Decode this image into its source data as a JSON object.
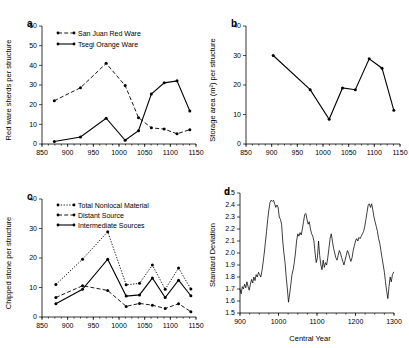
{
  "figure": {
    "title": "",
    "panels": [
      "a",
      "b",
      "c",
      "d"
    ]
  },
  "panel_a": {
    "letter": "a",
    "ylabel": "Red ware sherds per structure",
    "xlabel": "",
    "legend": [
      {
        "label": "San Juan Red Ware",
        "style": "dashed"
      },
      {
        "label": "Tsegi Orange Ware",
        "style": "solid"
      }
    ],
    "yticks": [
      "0",
      "10",
      "20",
      "30",
      "40",
      "50",
      "60"
    ],
    "xticks": [
      "850",
      "900",
      "950",
      "1000",
      "1050",
      "1100",
      "1150"
    ]
  },
  "panel_b": {
    "letter": "b",
    "ylabel": "Storage area (m²) per structure",
    "xlabel": "",
    "yticks": [
      "0",
      "10",
      "20",
      "30",
      "40"
    ],
    "xticks": [
      "850",
      "900",
      "950",
      "1000",
      "1050",
      "1100",
      "1150"
    ]
  },
  "panel_c": {
    "letter": "c",
    "ylabel": "Chipped stone per structure",
    "xlabel": "",
    "legend": [
      {
        "label": "Total Nonlocal Material",
        "style": "dotted"
      },
      {
        "label": "Distant Source",
        "style": "dashed"
      },
      {
        "label": "Intermediate Sources",
        "style": "solid"
      }
    ],
    "yticks": [
      "0",
      "10",
      "20",
      "30",
      "40"
    ],
    "xticks": [
      "850",
      "900",
      "950",
      "1000",
      "1050",
      "1100",
      "1150"
    ]
  },
  "panel_d": {
    "letter": "d",
    "ylabel": "Standard  Deviation",
    "xlabel": "Central Year",
    "yticks": [
      "1.5",
      "1.6",
      "1.7",
      "1.8",
      "1.9",
      "2.0",
      "2.1",
      "2.2",
      "2.3",
      "2.4",
      "2.5"
    ],
    "xticks": [
      "900",
      "1000",
      "1100",
      "1200",
      "1300"
    ]
  },
  "chart_data": [
    {
      "id": "panel_a",
      "type": "line",
      "title": "a",
      "xlabel": "",
      "ylabel": "Red ware sherds per structure",
      "xlim": [
        850,
        1150
      ],
      "ylim": [
        0,
        60
      ],
      "grid": false,
      "legend_position": "top-left",
      "series": [
        {
          "name": "San Juan Red Ware",
          "style": "dashed",
          "marker": "circle",
          "x": [
            874,
            925,
            975,
            1012,
            1038,
            1063,
            1088,
            1113,
            1138
          ],
          "y": [
            22,
            28.6,
            41,
            29.7,
            13.4,
            8.2,
            7.6,
            5.2,
            7.3
          ]
        },
        {
          "name": "Tsegi Orange Ware",
          "style": "solid",
          "marker": "circle",
          "x": [
            874,
            925,
            975,
            1012,
            1038,
            1063,
            1088,
            1113,
            1138
          ],
          "y": [
            1.3,
            3.6,
            13.1,
            1.9,
            6.8,
            25.4,
            31.1,
            32.1,
            16.8
          ]
        }
      ]
    },
    {
      "id": "panel_b",
      "type": "line",
      "title": "b",
      "xlabel": "",
      "ylabel": "Storage area (m2) per structure",
      "xlim": [
        850,
        1150
      ],
      "ylim": [
        0,
        40
      ],
      "grid": false,
      "series": [
        {
          "name": "Storage area per structure",
          "style": "solid",
          "marker": "circle",
          "x": [
            903,
            975,
            1012,
            1038,
            1063,
            1090,
            1115,
            1138
          ],
          "y": [
            30.0,
            18.4,
            8.4,
            19.0,
            18.4,
            28.9,
            25.7,
            11.4
          ]
        }
      ]
    },
    {
      "id": "panel_c",
      "type": "line",
      "title": "c",
      "xlabel": "",
      "ylabel": "Chipped stone per structure",
      "xlim": [
        850,
        1150
      ],
      "ylim": [
        0,
        40
      ],
      "grid": false,
      "legend_position": "top-left",
      "series": [
        {
          "name": "Total Nonlocal Material",
          "style": "dotted",
          "marker": "circle",
          "x": [
            877,
            929,
            978,
            1014,
            1040,
            1065,
            1090,
            1116,
            1140
          ],
          "y": [
            11.0,
            19.6,
            28.9,
            10.9,
            11.4,
            17.6,
            9.4,
            16.6,
            9.5
          ]
        },
        {
          "name": "Distant Source",
          "style": "dashed",
          "marker": "circle",
          "x": [
            877,
            929,
            978,
            1014,
            1040,
            1065,
            1090,
            1116,
            1140
          ],
          "y": [
            6.6,
            10.6,
            9.0,
            3.6,
            4.6,
            4.0,
            2.9,
            4.5,
            1.8
          ]
        },
        {
          "name": "Intermediate Sources",
          "style": "solid",
          "marker": "circle",
          "x": [
            877,
            929,
            978,
            1014,
            1040,
            1065,
            1090,
            1116,
            1140
          ],
          "y": [
            4.5,
            9.4,
            19.6,
            7.1,
            7.5,
            13.2,
            6.6,
            12.5,
            7.2
          ]
        }
      ]
    },
    {
      "id": "panel_d",
      "type": "line",
      "title": "d",
      "xlabel": "Central Year",
      "ylabel": "Standard Deviation",
      "xlim": [
        900,
        1300
      ],
      "ylim": [
        1.5,
        2.5
      ],
      "grid": false,
      "series": [
        {
          "name": "Standard Deviation",
          "style": "solid",
          "marker": "none",
          "x": [
            900,
            903,
            906,
            909,
            912,
            915,
            918,
            921,
            924,
            927,
            930,
            933,
            936,
            939,
            942,
            945,
            948,
            951,
            954,
            957,
            960,
            963,
            966,
            969,
            972,
            975,
            978,
            981,
            984,
            987,
            990,
            993,
            996,
            999,
            1002,
            1005,
            1008,
            1011,
            1014,
            1017,
            1020,
            1023,
            1026,
            1029,
            1032,
            1035,
            1038,
            1041,
            1044,
            1047,
            1050,
            1053,
            1056,
            1059,
            1062,
            1065,
            1068,
            1071,
            1074,
            1077,
            1080,
            1083,
            1086,
            1089,
            1092,
            1095,
            1098,
            1101,
            1104,
            1107,
            1110,
            1113,
            1116,
            1119,
            1122,
            1125,
            1128,
            1131,
            1134,
            1137,
            1140,
            1143,
            1146,
            1149,
            1152,
            1155,
            1158,
            1161,
            1164,
            1167,
            1170,
            1173,
            1176,
            1179,
            1182,
            1185,
            1188,
            1191,
            1194,
            1197,
            1200,
            1203,
            1206,
            1209,
            1212,
            1215,
            1218,
            1221,
            1224,
            1227,
            1230,
            1233,
            1236,
            1239,
            1242,
            1245,
            1248,
            1251,
            1254,
            1257,
            1260,
            1263,
            1266,
            1269,
            1272,
            1275,
            1278,
            1281,
            1284,
            1287,
            1290,
            1293,
            1296,
            1299
          ],
          "y": [
            1.7,
            1.66,
            1.72,
            1.7,
            1.74,
            1.71,
            1.76,
            1.72,
            1.69,
            1.74,
            1.78,
            1.75,
            1.8,
            1.77,
            1.82,
            1.8,
            1.84,
            1.82,
            1.8,
            1.85,
            1.92,
            2.0,
            2.09,
            2.18,
            2.28,
            2.36,
            2.42,
            2.44,
            2.43,
            2.44,
            2.41,
            2.38,
            2.4,
            2.38,
            2.3,
            2.28,
            2.24,
            2.1,
            2.0,
            1.92,
            1.8,
            1.7,
            1.59,
            1.66,
            1.74,
            1.82,
            1.86,
            1.92,
            2.0,
            2.1,
            2.16,
            2.14,
            2.17,
            2.15,
            2.2,
            2.26,
            2.32,
            2.33,
            2.28,
            2.24,
            2.26,
            2.2,
            2.16,
            2.14,
            2.1,
            2.0,
            1.92,
            1.96,
            2.1,
            1.98,
            1.9,
            1.86,
            1.94,
            1.88,
            1.92,
            1.9,
            1.96,
            2.04,
            2.12,
            2.16,
            2.1,
            2.04,
            2.0,
            1.96,
            1.94,
            1.98,
            2.02,
            2.0,
            1.96,
            1.93,
            1.9,
            1.94,
            1.98,
            2.02,
            2.0,
            1.96,
            1.93,
            1.96,
            2.02,
            2.06,
            2.1,
            2.12,
            2.1,
            2.13,
            2.12,
            2.14,
            2.16,
            2.18,
            2.22,
            2.28,
            2.34,
            2.4,
            2.41,
            2.38,
            2.41,
            2.36,
            2.3,
            2.26,
            2.22,
            2.18,
            2.12,
            2.08,
            2.02,
            1.96,
            1.9,
            1.84,
            1.76,
            1.68,
            1.62,
            1.72,
            1.8,
            1.76,
            1.82,
            1.84
          ]
        }
      ]
    }
  ]
}
